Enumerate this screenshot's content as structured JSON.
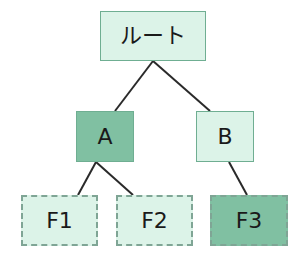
{
  "diagram": {
    "type": "tree",
    "colors": {
      "light_fill": "#dcf3e8",
      "dark_fill": "#80c0a2",
      "border": "#6fae92",
      "dashed_border": "#7fa595",
      "edge": "#2a2a2a",
      "text": "#1a1a1a"
    },
    "nodes": {
      "root": {
        "label": "ルート",
        "fill": "light",
        "border": "solid"
      },
      "a": {
        "label": "A",
        "fill": "dark",
        "border": "solid"
      },
      "b": {
        "label": "B",
        "fill": "light",
        "border": "solid"
      },
      "f1": {
        "label": "F1",
        "fill": "light",
        "border": "dashed"
      },
      "f2": {
        "label": "F2",
        "fill": "light",
        "border": "dashed"
      },
      "f3": {
        "label": "F3",
        "fill": "dark",
        "border": "dashed"
      }
    },
    "edges": [
      {
        "from": "root",
        "to": "a"
      },
      {
        "from": "root",
        "to": "b"
      },
      {
        "from": "a",
        "to": "f1"
      },
      {
        "from": "a",
        "to": "f2"
      },
      {
        "from": "b",
        "to": "f3"
      }
    ]
  }
}
